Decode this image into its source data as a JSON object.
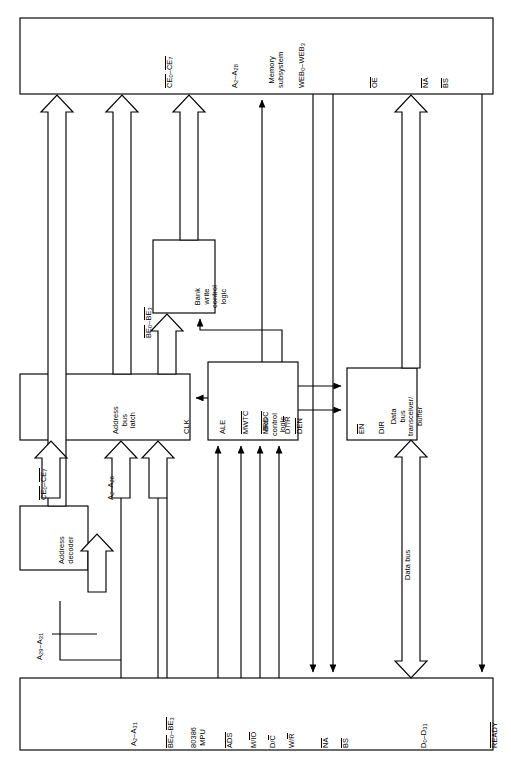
{
  "diagram": {
    "orientation": "rotated-90",
    "line_color": "#000000",
    "background": "#ffffff"
  },
  "blocks": {
    "memory_subsystem": {
      "label": "Memory subsystem",
      "line1": "Memory",
      "line2": "subsystem"
    },
    "address_bus_latch": {
      "line1": "Address",
      "line2": "bus",
      "line3": "latch",
      "clk_pin": "CLK"
    },
    "address_decoder": {
      "line1": "Address",
      "line2": "decoder"
    },
    "bank_write_control_logic": {
      "line1": "Bank",
      "line2": "write",
      "line3": "control",
      "line4": "logic"
    },
    "bus_control_logic": {
      "line1": "Bus",
      "line2": "control",
      "line3": "logic"
    },
    "data_bus_transceiver": {
      "line1": "Data",
      "line2": "bus",
      "line3": "transceiver/",
      "line4": "buffer"
    },
    "mpu": {
      "line1": "80386",
      "line2": "MPU"
    }
  },
  "memory_pins": [
    {
      "name": "chip-enable",
      "base": "CE",
      "sub1": "0",
      "base2": "CE",
      "sub2": "7",
      "overline": true,
      "text": "CE0–CE7"
    },
    {
      "name": "address",
      "base": "A",
      "sub1": "2",
      "base2": "A",
      "sub2": "28",
      "overline": false,
      "text": "A2–A28"
    },
    {
      "name": "write-enable-bank",
      "base": "WEB",
      "sub1": "0",
      "base2": "WEB",
      "sub2": "3",
      "overline": false,
      "text": "WEB0–WEB3"
    },
    {
      "name": "output-enable",
      "base": "OE",
      "sub1": "",
      "base2": "",
      "sub2": "",
      "overline": true,
      "text": "OE"
    },
    {
      "name": "next-address",
      "base": "NA",
      "sub1": "",
      "base2": "",
      "sub2": "",
      "overline": true,
      "text": "NA"
    },
    {
      "name": "bus-size",
      "base": "BS",
      "sub1": "",
      "base2": "",
      "sub2": "",
      "overline": true,
      "text": "BS"
    },
    {
      "name": "data",
      "base": "D",
      "sub1": "0",
      "base2": "D",
      "sub2": "31",
      "overline": false,
      "text": "D0–D31"
    },
    {
      "name": "ready",
      "base": "READY",
      "sub1": "",
      "base2": "",
      "sub2": "",
      "overline": true,
      "text": "READY"
    }
  ],
  "mpu_pins": [
    {
      "name": "address",
      "base": "A",
      "sub1": "2",
      "base2": "A",
      "sub2": "31",
      "overline": false,
      "text": "A2–A31"
    },
    {
      "name": "byte-enable",
      "base": "BE",
      "sub1": "0",
      "base2": "BE",
      "sub2": "3",
      "overline": true,
      "text": "BE0–BE3"
    },
    {
      "name": "address-status",
      "base": "ADS",
      "sub1": "",
      "base2": "",
      "sub2": "",
      "overline": true,
      "text": "ADS"
    },
    {
      "name": "memory-io",
      "base": "M/IO",
      "sub1": "",
      "base2": "",
      "sub2": "",
      "overline": "partial",
      "text": "M/IO"
    },
    {
      "name": "data-control",
      "base": "D/C",
      "sub1": "",
      "base2": "",
      "sub2": "",
      "overline": "partial",
      "text": "D/C"
    },
    {
      "name": "write-read",
      "base": "W/R",
      "sub1": "",
      "base2": "",
      "sub2": "",
      "overline": "partial",
      "text": "W/R"
    },
    {
      "name": "next-address",
      "base": "NA",
      "sub1": "",
      "base2": "",
      "sub2": "",
      "overline": true,
      "text": "NA"
    },
    {
      "name": "bus-size",
      "base": "BS",
      "sub1": "",
      "base2": "",
      "sub2": "",
      "overline": true,
      "text": "BS"
    },
    {
      "name": "data",
      "base": "D",
      "sub1": "0",
      "base2": "D",
      "sub2": "31",
      "overline": false,
      "text": "D0–D31"
    },
    {
      "name": "ready",
      "base": "READY",
      "sub1": "",
      "base2": "",
      "sub2": "",
      "overline": true,
      "text": "READY"
    }
  ],
  "bus_control_pins": [
    {
      "name": "ale",
      "text": "ALE",
      "overline": false
    },
    {
      "name": "mwtc",
      "text": "MWTC",
      "overline": true
    },
    {
      "name": "mrdc",
      "text": "MRDC",
      "overline": true
    },
    {
      "name": "dt-r",
      "text": "DT/R",
      "overline": "partial"
    },
    {
      "name": "den",
      "text": "DEN",
      "overline": true
    }
  ],
  "transceiver_pins": [
    {
      "name": "enable",
      "text": "EN",
      "overline": true
    },
    {
      "name": "direction",
      "text": "DIR",
      "overline": false
    }
  ],
  "bus_labels": {
    "chip_enable_bus": "CE0–CE7",
    "address_bus": "A2–A28",
    "byte_enable_bus": "BE0–BE3",
    "upper_address": "A29–A31",
    "data_bus": "Data bus"
  }
}
